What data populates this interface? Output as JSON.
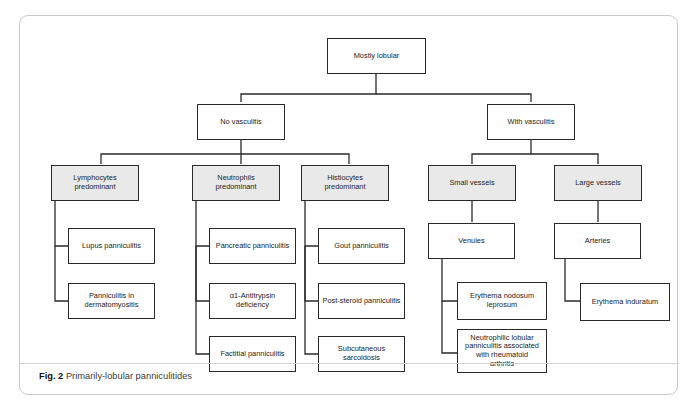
{
  "figure": {
    "label": "Fig. 2",
    "caption": "Primarily-lobular panniculitides",
    "border_color": "#c9c9c9",
    "node_border_color": "#2a2a2a",
    "shaded_fill": "#e9e9e9",
    "plain_fill": "#ffffff"
  },
  "diagram": {
    "type": "flowchart",
    "orientation": "top-down",
    "root": "Mostly lobular",
    "nodes": {
      "root": {
        "label": "Mostly lobular",
        "shaded": false
      },
      "no_vasculitis": {
        "label": "No vasculitis",
        "shaded": false
      },
      "with_vasculitis": {
        "label": "With vasculitis",
        "shaded": false
      },
      "lymphocytes": {
        "label": "Lymphocytes predominant",
        "line1": "Lymphocytes",
        "line2": "predominant",
        "shaded": true
      },
      "neutrophils": {
        "label": "Neutrophils predominant",
        "line1": "Neutrophils",
        "line2": "predominant",
        "shaded": true
      },
      "histiocytes": {
        "label": "Histiocytes predominant",
        "line1": "Histiocytes",
        "line2": "predominant",
        "shaded": true
      },
      "small_vessels": {
        "label": "Small vessels",
        "shaded": true
      },
      "large_vessels": {
        "label": "Large vessels",
        "shaded": true
      },
      "lupus": {
        "label": "Lupus panniculitis",
        "shaded": false
      },
      "dermatomyositis": {
        "label": "Panniculitis in dermatomyositis",
        "line1": "Panniculitis in",
        "line2": "dermatomyositis",
        "shaded": false
      },
      "pancreatic": {
        "label": "Pancreatic panniculitis",
        "shaded": false
      },
      "antitrypsin": {
        "label": "α1-Antitrypsin deficiency",
        "line1": "α1-Antitrypsin",
        "line2": "deficiency",
        "shaded": false
      },
      "factitial": {
        "label": "Factitial panniculitis",
        "shaded": false
      },
      "gout": {
        "label": "Gout panniculitis",
        "shaded": false
      },
      "post_steroid": {
        "label": "Post-steroid panniculitis",
        "shaded": false
      },
      "sarcoidosis": {
        "label": "Subcutaneous sarcoidosis",
        "line1": "Subcutaneous",
        "line2": "sarcoidosis",
        "shaded": false
      },
      "venules": {
        "label": "Venules",
        "shaded": false
      },
      "arteries": {
        "label": "Arteries",
        "shaded": false
      },
      "eryth_nodosum": {
        "label": "Erythema nodosum leprosum",
        "line1": "Erythema nodosum",
        "line2": "leprosum",
        "shaded": false
      },
      "neutrophilic_ra": {
        "label": "Neutrophilic lobular panniculitis associated with rheumatoid arthritis",
        "line1": "Neutrophilic lobular",
        "line2": "panniculitis associated",
        "line3": "with rheumatoid",
        "line4": "arthritis",
        "shaded": false
      },
      "eryth_induratum": {
        "label": "Erythema induratum",
        "shaded": false
      }
    },
    "edges": [
      {
        "from": "root",
        "to": "no_vasculitis"
      },
      {
        "from": "root",
        "to": "with_vasculitis"
      },
      {
        "from": "no_vasculitis",
        "to": "lymphocytes"
      },
      {
        "from": "no_vasculitis",
        "to": "neutrophils"
      },
      {
        "from": "no_vasculitis",
        "to": "histiocytes"
      },
      {
        "from": "with_vasculitis",
        "to": "small_vessels"
      },
      {
        "from": "with_vasculitis",
        "to": "large_vessels"
      },
      {
        "from": "lymphocytes",
        "to": "lupus"
      },
      {
        "from": "lymphocytes",
        "to": "dermatomyositis"
      },
      {
        "from": "neutrophils",
        "to": "pancreatic"
      },
      {
        "from": "neutrophils",
        "to": "antitrypsin"
      },
      {
        "from": "neutrophils",
        "to": "factitial"
      },
      {
        "from": "histiocytes",
        "to": "gout"
      },
      {
        "from": "histiocytes",
        "to": "post_steroid"
      },
      {
        "from": "histiocytes",
        "to": "sarcoidosis"
      },
      {
        "from": "small_vessels",
        "to": "venules"
      },
      {
        "from": "large_vessels",
        "to": "arteries"
      },
      {
        "from": "venules",
        "to": "eryth_nodosum"
      },
      {
        "from": "venules",
        "to": "neutrophilic_ra"
      },
      {
        "from": "arteries",
        "to": "eryth_induratum"
      }
    ]
  }
}
